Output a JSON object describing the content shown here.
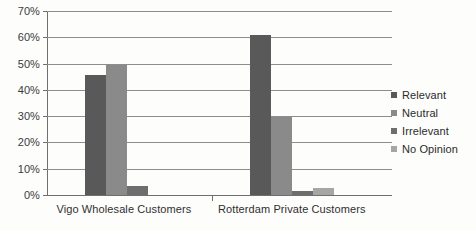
{
  "chart_data": {
    "type": "bar",
    "title": "",
    "xlabel": "",
    "ylabel": "",
    "categories": [
      "Vigo Wholesale Customers",
      "Rotterdam Private Customers"
    ],
    "series": [
      {
        "name": "Relevant",
        "values": [
          45.5,
          61.0
        ],
        "color": "#595959"
      },
      {
        "name": "Neutral",
        "values": [
          49.5,
          29.5
        ],
        "color": "#8a8a8a"
      },
      {
        "name": "Irrelevant",
        "values": [
          3.5,
          1.5
        ],
        "color": "#6e6e6e"
      },
      {
        "name": "No Opinion",
        "values": [
          0,
          2.5
        ],
        "color": "#a6a6a6"
      }
    ],
    "ylim": [
      0,
      70
    ],
    "ytick_labels": [
      "70%",
      "60%",
      "50%",
      "40%",
      "30%",
      "20%",
      "10%",
      "0%"
    ],
    "ytick_values": [
      70,
      60,
      50,
      40,
      30,
      20,
      10,
      0
    ],
    "grid": true,
    "legend_position": "right"
  },
  "legend": {
    "items": [
      {
        "label": "Relevant"
      },
      {
        "label": "Neutral"
      },
      {
        "label": "Irrelevant"
      },
      {
        "label": "No Opinion"
      }
    ]
  },
  "axis": {
    "y_labels": [
      "70%",
      "60%",
      "50%",
      "40%",
      "30%",
      "20%",
      "10%",
      "0%"
    ],
    "x_labels": [
      "Vigo Wholesale Customers",
      "Rotterdam Private Customers"
    ]
  },
  "artifacts": {
    "ghost_line_1": "",
    "ghost_line_2": ""
  }
}
